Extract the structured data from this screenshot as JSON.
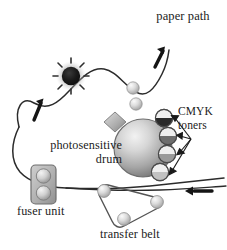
{
  "figure": {
    "background_color": "#ffffff",
    "ink_color": "#1b1b1b",
    "width": 227,
    "height": 250
  },
  "labels": {
    "paper_path": "paper path",
    "cmyk_toners": "CMYK toners",
    "photosensitive_drum": "photosensitive drum",
    "fuser_unit": "fuser unit",
    "transfer_belt": "transfer belt"
  },
  "components": {
    "paper_path_curve": {
      "name": "paper path",
      "stroke_color": "#2b2b2b",
      "direction_arrows": 3
    },
    "photosensitive_drum": {
      "name": "photosensitive drum",
      "shape": "sphere",
      "fill_light": "#e8e8e8",
      "fill_dark": "#777777",
      "radius_px": 29
    },
    "laser_unit": {
      "name": "laser scanner",
      "shape": "diamond",
      "fill": "#b8b8b8"
    },
    "toner_cartridges": {
      "count": 4,
      "names": [
        "cyan toner",
        "magenta toner",
        "yellow toner",
        "black toner"
      ],
      "fills": [
        "#2a2a2a",
        "#6e6e6e",
        "#9a9a9a",
        "#c2c2c2"
      ]
    },
    "fuser_unit": {
      "name": "fuser unit",
      "shape": "rounded-rectangle",
      "fill": "#b5b5b5",
      "roller_count": 2
    },
    "transfer_belt": {
      "name": "transfer belt",
      "shape": "rounded-triangle",
      "roller_count": 3,
      "roller_fill": "#d8d8d8"
    },
    "toner_blob": {
      "name": "fused toner spot",
      "fill": "#141414",
      "shape": "starburst"
    },
    "loose_toner_spheres": {
      "count": 2,
      "fill": "#d2d2d2"
    }
  }
}
